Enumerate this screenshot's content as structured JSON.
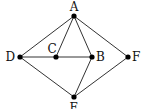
{
  "diagram": {
    "type": "graph",
    "nodes": [
      {
        "id": "A",
        "label": "A",
        "x": 74,
        "y": 16,
        "lx": 74,
        "ly": 11,
        "anchor": "middle"
      },
      {
        "id": "B",
        "label": "B",
        "x": 92,
        "y": 57,
        "lx": 96,
        "ly": 61,
        "anchor": "start"
      },
      {
        "id": "C",
        "label": "C",
        "x": 56,
        "y": 57,
        "lx": 52,
        "ly": 53,
        "anchor": "middle"
      },
      {
        "id": "D",
        "label": "D",
        "x": 20,
        "y": 57,
        "lx": 15,
        "ly": 61,
        "anchor": "end"
      },
      {
        "id": "E",
        "label": "E",
        "x": 74,
        "y": 97,
        "lx": 74,
        "ly": 112,
        "anchor": "middle"
      },
      {
        "id": "F",
        "label": "F",
        "x": 128,
        "y": 57,
        "lx": 132,
        "ly": 61,
        "anchor": "start"
      }
    ],
    "edges": [
      [
        "A",
        "D"
      ],
      [
        "A",
        "C"
      ],
      [
        "A",
        "B"
      ],
      [
        "A",
        "F"
      ],
      [
        "D",
        "C"
      ],
      [
        "C",
        "B"
      ],
      [
        "D",
        "E"
      ],
      [
        "B",
        "E"
      ],
      [
        "F",
        "E"
      ]
    ],
    "colors": {
      "line": "#333333",
      "node": "#000000"
    }
  }
}
